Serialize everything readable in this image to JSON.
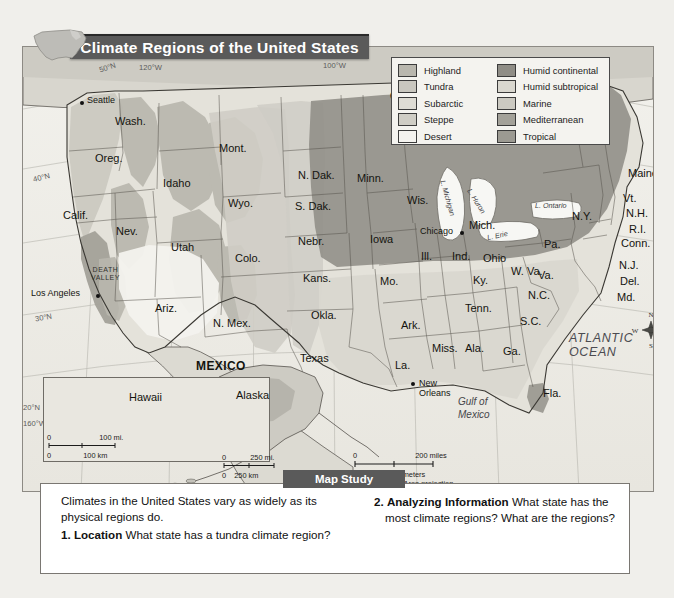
{
  "title": "Climate Regions of the United States",
  "map_study_label": "Map Study",
  "legend": {
    "left_column": [
      {
        "label": "Highland",
        "color": "#b9b7ae"
      },
      {
        "label": "Tundra",
        "color": "#c9c7bf"
      },
      {
        "label": "Subarctic",
        "color": "#dedcd4"
      },
      {
        "label": "Steppe",
        "color": "#cfcdc5"
      },
      {
        "label": "Desert",
        "color": "#f3f2ee"
      }
    ],
    "right_column": [
      {
        "label": "Humid continental",
        "color": "#8f8d86"
      },
      {
        "label": "Humid subtropical",
        "color": "#d9d7cf"
      },
      {
        "label": "Marine",
        "color": "#cbc9c1"
      },
      {
        "label": "Mediterranean",
        "color": "#a3a199"
      },
      {
        "label": "Tropical",
        "color": "#9c9a92"
      }
    ]
  },
  "countries": [
    "CANADA",
    "MEXICO"
  ],
  "states": [
    {
      "name": "Wash.",
      "x": 92,
      "y": 68
    },
    {
      "name": "Oreg.",
      "x": 72,
      "y": 105
    },
    {
      "name": "Calif.",
      "x": 40,
      "y": 162
    },
    {
      "name": "Nev.",
      "x": 93,
      "y": 178
    },
    {
      "name": "Idaho",
      "x": 140,
      "y": 130
    },
    {
      "name": "Mont.",
      "x": 196,
      "y": 95
    },
    {
      "name": "Wyo.",
      "x": 205,
      "y": 150
    },
    {
      "name": "Utah",
      "x": 148,
      "y": 194
    },
    {
      "name": "Colo.",
      "x": 212,
      "y": 205
    },
    {
      "name": "Ariz.",
      "x": 132,
      "y": 255
    },
    {
      "name": "N. Mex.",
      "x": 190,
      "y": 270
    },
    {
      "name": "N. Dak.",
      "x": 275,
      "y": 122
    },
    {
      "name": "S. Dak.",
      "x": 272,
      "y": 153
    },
    {
      "name": "Nebr.",
      "x": 275,
      "y": 188
    },
    {
      "name": "Kans.",
      "x": 280,
      "y": 225
    },
    {
      "name": "Okla.",
      "x": 288,
      "y": 262
    },
    {
      "name": "Texas",
      "x": 277,
      "y": 305
    },
    {
      "name": "Minn.",
      "x": 334,
      "y": 125
    },
    {
      "name": "Iowa",
      "x": 347,
      "y": 186
    },
    {
      "name": "Mo.",
      "x": 357,
      "y": 228
    },
    {
      "name": "Ark.",
      "x": 378,
      "y": 272
    },
    {
      "name": "La.",
      "x": 372,
      "y": 312
    },
    {
      "name": "Wis.",
      "x": 384,
      "y": 147
    },
    {
      "name": "Ill.",
      "x": 398,
      "y": 203
    },
    {
      "name": "Miss.",
      "x": 409,
      "y": 295
    },
    {
      "name": "Ala.",
      "x": 442,
      "y": 295
    },
    {
      "name": "Tenn.",
      "x": 442,
      "y": 255
    },
    {
      "name": "Ky.",
      "x": 450,
      "y": 227
    },
    {
      "name": "Ind.",
      "x": 429,
      "y": 203
    },
    {
      "name": "Ohio",
      "x": 460,
      "y": 205
    },
    {
      "name": "Mich.",
      "x": 446,
      "y": 172
    },
    {
      "name": "Ga.",
      "x": 480,
      "y": 298
    },
    {
      "name": "Fla.",
      "x": 520,
      "y": 340
    },
    {
      "name": "S.C.",
      "x": 497,
      "y": 268
    },
    {
      "name": "N.C.",
      "x": 505,
      "y": 242
    },
    {
      "name": "Va.",
      "x": 515,
      "y": 222
    },
    {
      "name": "W. Va.",
      "x": 488,
      "y": 218
    },
    {
      "name": "Pa.",
      "x": 521,
      "y": 191
    },
    {
      "name": "N.Y.",
      "x": 549,
      "y": 163
    },
    {
      "name": "Maine",
      "x": 605,
      "y": 120
    },
    {
      "name": "Vt.",
      "x": 600,
      "y": 145
    },
    {
      "name": "N.H.",
      "x": 603,
      "y": 160
    },
    {
      "name": "R.I.",
      "x": 606,
      "y": 176
    },
    {
      "name": "Conn.",
      "x": 598,
      "y": 190
    },
    {
      "name": "N.J.",
      "x": 596,
      "y": 212
    },
    {
      "name": "Del.",
      "x": 597,
      "y": 228
    },
    {
      "name": "Md.",
      "x": 594,
      "y": 244
    }
  ],
  "cities": [
    {
      "name": "Seattle",
      "x": 62,
      "y": 53
    },
    {
      "name": "Los Angeles",
      "x": 12,
      "y": 245
    },
    {
      "name": "Chicago",
      "x": 403,
      "y": 187
    },
    {
      "name": "New Orleans",
      "x": 400,
      "y": 337
    }
  ],
  "water_features": [
    {
      "name": "ATLANTIC\nOCEAN",
      "x": 558,
      "y": 298
    },
    {
      "name": "Gulf of\nMexico",
      "x": 452,
      "y": 356
    }
  ],
  "lakes": [
    "L. Ontario",
    "L. Erie",
    "L. Michigan",
    "L. Huron"
  ],
  "physical_features": [
    "DEATH\nVALLEY"
  ],
  "grid_labels": [
    "50°N",
    "120°W",
    "100°W",
    "40°N",
    "30°N",
    "140°W",
    "160°W",
    "20°N",
    "155°W",
    "60°W"
  ],
  "insets": [
    {
      "name": "Hawaii"
    },
    {
      "name": "Alaska"
    }
  ],
  "scales": {
    "main": {
      "miles": "200 miles",
      "kilometers": "200 kilometers",
      "zero": "0",
      "projection": "Lambert Equal-Area projection"
    },
    "hawaii": {
      "miles": "100 mi.",
      "kilometers": "100 km",
      "zero": "0"
    },
    "alaska": {
      "miles": "250 mi.",
      "kilometers": "250 km",
      "zero": "0"
    }
  },
  "compass": {
    "n": "N",
    "s": "S",
    "e": "E",
    "w": "W"
  },
  "questions": {
    "intro": "Climates in the United States vary as widely as its physical regions do.",
    "items": [
      {
        "number": "1.",
        "term": "Location",
        "text": "What state has a tundra climate region?"
      },
      {
        "number": "2.",
        "term": "Analyzing Information",
        "text": "What state has the most climate regions?  What are the regions?"
      }
    ]
  }
}
